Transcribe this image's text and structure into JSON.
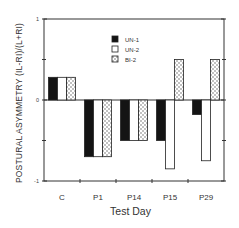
{
  "chart_data": {
    "type": "bar",
    "title": "",
    "xlabel": "Test Day",
    "ylabel": "POSTURAL ASYMMETRY (IL-RI)/(L+RI)",
    "ylim": [
      -1,
      1
    ],
    "yticks": [
      -1,
      0,
      1
    ],
    "grid": false,
    "legend_position": "upper-left-inside",
    "categories": [
      "C",
      "P1",
      "P14",
      "P15",
      "P29"
    ],
    "series": [
      {
        "name": "UN-1",
        "fill": "solid-black",
        "values": [
          0.28,
          -0.7,
          -0.5,
          -0.5,
          -0.18
        ]
      },
      {
        "name": "UN-2",
        "fill": "white",
        "values": [
          0.28,
          -0.7,
          -0.5,
          -0.85,
          -0.75
        ]
      },
      {
        "name": "BI-2",
        "fill": "dotted-pattern",
        "values": [
          0.28,
          -0.7,
          -0.5,
          0.5,
          0.5
        ]
      }
    ]
  },
  "labels": {
    "xlabel": "Test Day",
    "ylabel": "POSTURAL ASYMMETRY (IL-RI)/(L+RI)"
  }
}
